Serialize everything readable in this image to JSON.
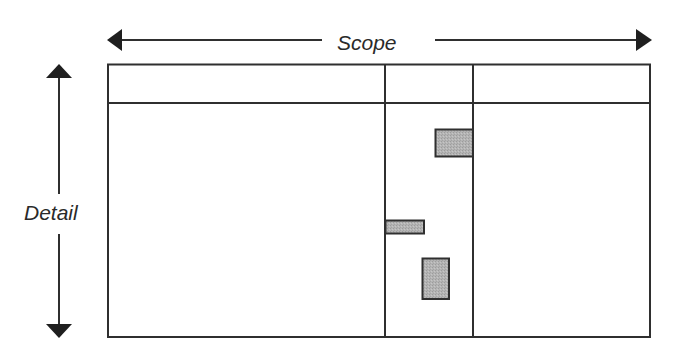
{
  "diagram": {
    "horizontal_axis": {
      "label": "Scope",
      "direction": "bidirectional"
    },
    "vertical_axis": {
      "label": "Detail",
      "direction": "bidirectional"
    },
    "grid": {
      "columns": 3,
      "header_row": true
    },
    "blocks": [
      {
        "name": "upper-block",
        "column": 2,
        "position": "upper, right-aligned in column"
      },
      {
        "name": "middle-bar",
        "column": 2,
        "position": "middle, left-aligned in column"
      },
      {
        "name": "lower-block",
        "column": 2,
        "position": "lower, centered in column"
      }
    ],
    "colors": {
      "line": "#2f2f2f",
      "block_fill": "#b2b2b2",
      "background": "#ffffff"
    }
  }
}
